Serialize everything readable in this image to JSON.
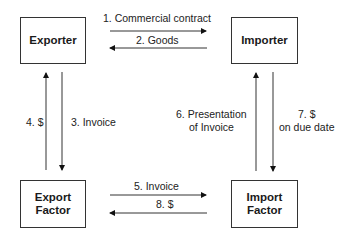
{
  "diagram": {
    "type": "flowchart",
    "nodes": [
      {
        "id": "exporter",
        "label": "Exporter"
      },
      {
        "id": "importer",
        "label": "Importer"
      },
      {
        "id": "export_factor",
        "label": "Export\nFactor"
      },
      {
        "id": "import_factor",
        "label": "Import\nFactor"
      }
    ],
    "edges": [
      {
        "from": "exporter",
        "to": "importer",
        "label": "1. Commercial contract"
      },
      {
        "from": "importer",
        "to": "exporter",
        "label": "2. Goods"
      },
      {
        "from": "exporter",
        "to": "export_factor",
        "label": "3. Invoice"
      },
      {
        "from": "export_factor",
        "to": "exporter",
        "label": "4. $"
      },
      {
        "from": "export_factor",
        "to": "import_factor",
        "label": "5. Invoice"
      },
      {
        "from": "import_factor",
        "to": "importer",
        "label": "6. Presentation of Invoice"
      },
      {
        "from": "importer",
        "to": "import_factor",
        "label": "7. $ on due date"
      },
      {
        "from": "import_factor",
        "to": "export_factor",
        "label": "8. $"
      }
    ]
  },
  "labels": {
    "exporter": "Exporter",
    "importer": "Importer",
    "export_factor": "Export\nFactor",
    "import_factor": "Import\nFactor",
    "e1": "1. Commercial contract",
    "e2": "2. Goods",
    "e3": "3. Invoice",
    "e4": "4. $",
    "e5": "5. Invoice",
    "e6_line1": "6. Presentation",
    "e6_line2": "of Invoice",
    "e7_line1": "7. $",
    "e7_line2": "on due date",
    "e8": "8. $"
  }
}
